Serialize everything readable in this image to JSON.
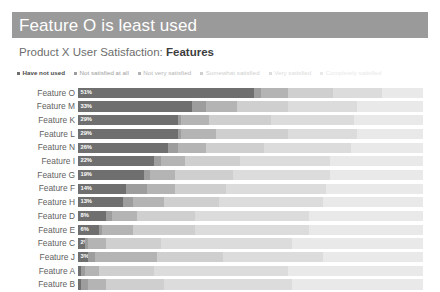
{
  "header": {
    "title": "Feature O is least used",
    "title_bg": "#9a9a9a",
    "subtitle_prefix": "Product X User Satisfaction: ",
    "subtitle_strong": "Features"
  },
  "legend": {
    "items": [
      {
        "label": "Have not used",
        "color": "#6f6f6f",
        "emphasis": true
      },
      {
        "label": "Not satisfied at all",
        "color": "#9d9d9d",
        "emphasis": false
      },
      {
        "label": "Not very satisfied",
        "color": "#b4b4b4",
        "emphasis": false
      },
      {
        "label": "Somewhat satisfied",
        "color": "#cfcfcf",
        "emphasis": false
      },
      {
        "label": "Very satisfied",
        "color": "#dcdcdc",
        "emphasis": false
      },
      {
        "label": "Completely satisfied",
        "color": "#e9e9e9",
        "emphasis": false
      }
    ]
  },
  "chart_data": {
    "type": "bar",
    "subtype": "stacked-horizontal-100",
    "title": "Feature O is least used",
    "subtitle": "Product X User Satisfaction: Features",
    "xlabel": "",
    "ylabel": "",
    "xlim": [
      0,
      100
    ],
    "grid": false,
    "legend_position": "top",
    "series": [
      {
        "name": "Have not used",
        "color": "#6f6f6f"
      },
      {
        "name": "Not satisfied at all",
        "color": "#9d9d9d"
      },
      {
        "name": "Not very satisfied",
        "color": "#b4b4b4"
      },
      {
        "name": "Somewhat satisfied",
        "color": "#cfcfcf"
      },
      {
        "name": "Very satisfied",
        "color": "#dcdcdc"
      },
      {
        "name": "Completely satisfied",
        "color": "#e9e9e9"
      }
    ],
    "categories": [
      "Feature O",
      "Feature M",
      "Feature K",
      "Feature L",
      "Feature N",
      "Feature I",
      "Feature G",
      "Feature F",
      "Feature H",
      "Feature D",
      "Feature E",
      "Feature C",
      "Feature J",
      "Feature A",
      "Feature B"
    ],
    "rows": [
      {
        "category": "Feature O",
        "label": "51%",
        "values": [
          51,
          2,
          8,
          13,
          14,
          12
        ]
      },
      {
        "category": "Feature M",
        "label": "33%",
        "values": [
          33,
          4,
          9,
          15,
          20,
          19
        ]
      },
      {
        "category": "Feature K",
        "label": "29%",
        "values": [
          29,
          1,
          8,
          18,
          24,
          20
        ]
      },
      {
        "category": "Feature L",
        "label": "29%",
        "values": [
          29,
          1,
          10,
          21,
          20,
          19
        ]
      },
      {
        "category": "Feature N",
        "label": "26%",
        "values": [
          26,
          3,
          8,
          17,
          25,
          21
        ]
      },
      {
        "category": "Feature I",
        "label": "22%",
        "values": [
          22,
          2,
          7,
          16,
          26,
          27
        ]
      },
      {
        "category": "Feature G",
        "label": "19%",
        "values": [
          19,
          2,
          7,
          17,
          28,
          27
        ]
      },
      {
        "category": "Feature F",
        "label": "14%",
        "values": [
          14,
          6,
          8,
          15,
          29,
          28
        ]
      },
      {
        "category": "Feature H",
        "label": "13%",
        "values": [
          13,
          3,
          9,
          16,
          30,
          29
        ]
      },
      {
        "category": "Feature D",
        "label": "8%",
        "values": [
          8,
          2,
          7,
          17,
          33,
          33
        ]
      },
      {
        "category": "Feature E",
        "label": "6%",
        "values": [
          6,
          1,
          9,
          18,
          33,
          33
        ]
      },
      {
        "category": "Feature C",
        "label": "2%",
        "values": [
          2,
          1,
          5,
          16,
          38,
          38
        ]
      },
      {
        "category": "Feature J",
        "label": "3%",
        "values": [
          3,
          2,
          18,
          19,
          29,
          29
        ]
      },
      {
        "category": "Feature A",
        "label": "",
        "values": [
          1,
          1,
          4,
          16,
          39,
          39
        ]
      },
      {
        "category": "Feature B",
        "label": "",
        "values": [
          1,
          2,
          5,
          17,
          37,
          38
        ]
      }
    ]
  }
}
